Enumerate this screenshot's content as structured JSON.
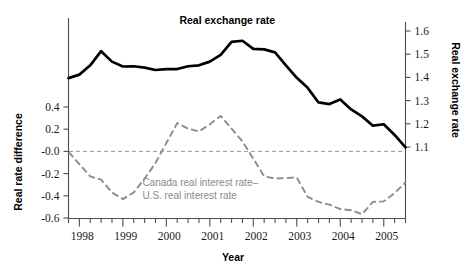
{
  "chart_data": {
    "type": "line",
    "title": "",
    "xlabel": "Year",
    "ylabel": "Real rate difference",
    "ylabel_right": "Real exchange rate",
    "grid": false,
    "legend_position": "inline-annotation",
    "xlim": [
      1997.75,
      2005.5
    ],
    "ylim_left": [
      -0.6,
      0.7
    ],
    "ylim_right": [
      1.05,
      1.6
    ],
    "x_ticks_major": [
      "1998",
      "1999",
      "2000",
      "2001",
      "2002",
      "2003",
      "2004",
      "2005"
    ],
    "x_tick_values": [
      1998,
      1999,
      2000,
      2001,
      2002,
      2003,
      2004,
      2005
    ],
    "x_minor_tick_step": 0.25,
    "y_ticks_left": [
      "0.4",
      "0.2",
      "-0.0",
      "-0.2",
      "-0.4",
      "-0.6"
    ],
    "y_tick_values_left": [
      0.4,
      0.2,
      0.0,
      -0.2,
      -0.4,
      -0.6
    ],
    "y_ticks_right": [
      "1.6",
      "1.5",
      "1.4",
      "1.3",
      "1.2",
      "1.1"
    ],
    "y_tick_values_right": [
      1.6,
      1.5,
      1.4,
      1.3,
      1.2,
      1.1
    ],
    "zero_reference_line": 0.0,
    "series": [
      {
        "name": "Real exchange rate",
        "label": "Real exchange rate",
        "axis": "right",
        "style": "solid",
        "color": "#000000",
        "x": [
          1997.75,
          1998.0,
          1998.25,
          1998.5,
          1998.75,
          1999.0,
          1999.25,
          1999.5,
          1999.75,
          2000.0,
          2000.25,
          2000.5,
          2000.75,
          2001.0,
          2001.25,
          2001.5,
          2001.75,
          2002.0,
          2002.25,
          2002.5,
          2002.75,
          2003.0,
          2003.25,
          2003.5,
          2003.75,
          2004.0,
          2004.25,
          2004.5,
          2004.75,
          2005.0,
          2005.25,
          2005.5
        ],
        "values": [
          1.397,
          1.412,
          1.452,
          1.513,
          1.468,
          1.447,
          1.448,
          1.442,
          1.432,
          1.436,
          1.436,
          1.448,
          1.452,
          1.468,
          1.497,
          1.553,
          1.558,
          1.523,
          1.521,
          1.508,
          1.452,
          1.398,
          1.355,
          1.292,
          1.285,
          1.305,
          1.262,
          1.232,
          1.192,
          1.198,
          1.152,
          1.098
        ]
      },
      {
        "name": "Canada real interest rate minus U.S. real interest rate",
        "label": "Canada real interest rate–\nU.S. real interest rate",
        "label_line1": "Canada real interest rate–",
        "label_line2": "U.S. real interest rate",
        "axis": "left",
        "style": "dashed",
        "color": "#8c8c8c",
        "x": [
          1997.75,
          1998.0,
          1998.25,
          1998.5,
          1998.75,
          1999.0,
          1999.25,
          1999.5,
          1999.75,
          2000.0,
          2000.25,
          2000.5,
          2000.75,
          2001.0,
          2001.25,
          2001.5,
          2001.75,
          2002.0,
          2002.25,
          2002.5,
          2002.75,
          2003.0,
          2003.25,
          2003.5,
          2003.75,
          2004.0,
          2004.25,
          2004.5,
          2004.75,
          2005.0,
          2005.25,
          2005.5
        ],
        "values": [
          -0.005,
          -0.115,
          -0.225,
          -0.255,
          -0.37,
          -0.43,
          -0.37,
          -0.245,
          -0.105,
          0.075,
          0.255,
          0.205,
          0.18,
          0.245,
          0.32,
          0.205,
          0.09,
          -0.065,
          -0.225,
          -0.245,
          -0.24,
          -0.235,
          -0.41,
          -0.455,
          -0.48,
          -0.52,
          -0.53,
          -0.565,
          -0.455,
          -0.45,
          -0.375,
          -0.28
        ]
      }
    ],
    "annotations": [
      {
        "text": "Real exchange rate",
        "x": 2000.3,
        "y_px": 24,
        "color": "#000000",
        "weight": "bold"
      },
      {
        "text": "Canada real interest rate–",
        "x": 1999.45,
        "y_px": 186,
        "color": "#8a8a8a",
        "weight": "normal"
      },
      {
        "text": "U.S. real interest rate",
        "x": 1999.45,
        "y_px": 199,
        "color": "#8a8a8a",
        "weight": "normal"
      }
    ]
  },
  "axes": {
    "x_axis_title": "Year",
    "y_axis_left_title": "Real rate difference",
    "y_axis_right_title": "Real exchange rate"
  },
  "colors": {
    "exchange_rate_line": "#000000",
    "rate_difference_line": "#8c8c8c",
    "axis": "#4d4d4d",
    "zero_line": "#9a9a9a",
    "background": "#ffffff",
    "gray_text": "#8a8a8a"
  }
}
